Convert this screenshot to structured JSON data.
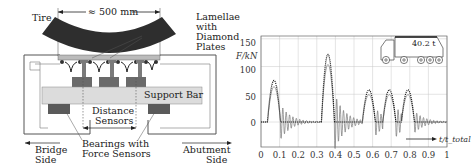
{
  "diagram": {
    "labels": {
      "tire": "Tire",
      "width": "≈ 500 mm",
      "lamellae_1": "Lamellae",
      "lamellae_2": "with",
      "lamellae_3": "Diamond",
      "lamellae_4": "Plates",
      "support_bar": "Support Bar",
      "distance_1": "Distance",
      "distance_2": "Sensors",
      "bearings_1": "Bearings with",
      "bearings_2": "Force Sensors",
      "bridge_1": "Bridge",
      "bridge_2": "Side",
      "abutment_1": "Abutment",
      "abutment_2": "Side"
    },
    "colors": {
      "tire": "#2e2e2e",
      "support_bar": "#dcdcdc",
      "bearing": "#5a5a5a",
      "beam": "#6e6e6e",
      "frame": "#555555"
    }
  },
  "chart_data": {
    "type": "line",
    "title": "",
    "xlabel": "t/t_total",
    "ylabel": "F/kN",
    "xlim": [
      0,
      1
    ],
    "ylim": [
      -45,
      155
    ],
    "xticks": [
      "0",
      "0.1",
      "0.2",
      "0.3",
      "0.4",
      "0.5",
      "0.6",
      "0.7",
      "0.8",
      "0.9",
      "1"
    ],
    "yticks": [
      "0",
      "50",
      "100",
      "150"
    ],
    "grid": true,
    "annotation": {
      "truck_load": "40.2 t",
      "arrow_label": "t/t_total"
    },
    "series": [
      {
        "name": "force (dotted, envelope)",
        "style": "dotted",
        "peaks": [
          {
            "x": 0.07,
            "y": 75
          },
          {
            "x": 0.36,
            "y": 122
          },
          {
            "x": 0.58,
            "y": 58
          },
          {
            "x": 0.69,
            "y": 58
          },
          {
            "x": 0.79,
            "y": 58
          }
        ]
      },
      {
        "name": "displacement/oscillation (solid grey)",
        "style": "solid",
        "description": "damped oscillations following each peak, min ≈ -35 kN"
      }
    ]
  }
}
